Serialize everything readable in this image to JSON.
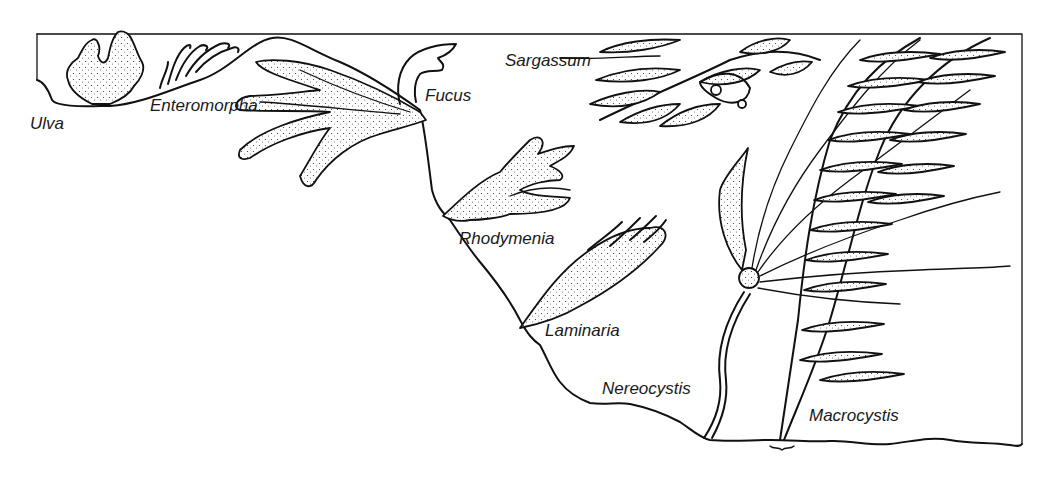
{
  "figure": {
    "type": "illustration",
    "colors": {
      "ink": "#111111",
      "background": "#ffffff"
    }
  },
  "labels": {
    "ulva": "Ulva",
    "enteromorpha": "Enteromorpha",
    "fucus": "Fucus",
    "sargassum": "Sargassum",
    "rhodymenia": "Rhodymenia",
    "laminaria": "Laminaria",
    "nereocystis": "Nereocystis",
    "macrocystis": "Macrocystis"
  }
}
